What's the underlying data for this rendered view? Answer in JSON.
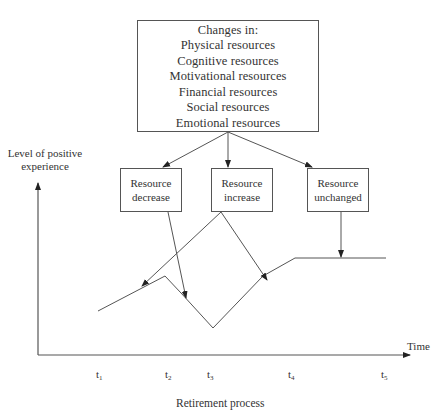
{
  "main_box": {
    "title": "Changes in:",
    "items": [
      "Physical  resources",
      "Cognitive  resources",
      "Motivational  resources",
      "Financial  resources",
      "Social  resources",
      "Emotional  resources"
    ]
  },
  "outcome_boxes": [
    {
      "line1": "Resource",
      "line2": "decrease"
    },
    {
      "line1": "Resource",
      "line2": "increase"
    },
    {
      "line1": "Resource",
      "line2": "unchanged"
    }
  ],
  "axes": {
    "y_label_line1": "Level of positive",
    "y_label_line2": "experience",
    "x_label": "Time",
    "x_caption": "Retirement process"
  },
  "ticks": [
    {
      "base": "t",
      "sub": "1"
    },
    {
      "base": "t",
      "sub": "2"
    },
    {
      "base": "t",
      "sub": "3"
    },
    {
      "base": "t",
      "sub": "4"
    },
    {
      "base": "t",
      "sub": "5"
    }
  ],
  "colors": {
    "line": "#555555",
    "text": "#333333",
    "background": "#ffffff"
  }
}
